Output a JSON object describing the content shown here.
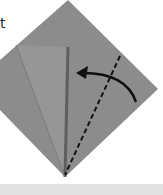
{
  "diagram": {
    "label_text": "t",
    "colors": {
      "paper": "#8c8c8c",
      "flap": "#969696",
      "crease_dark": "#5a5a5a",
      "fold_line": "#111111",
      "arrow": "#111111",
      "bottom_strip": "#e2e2e2"
    },
    "steps": [
      {
        "type": "valley-fold-line",
        "style": "dashed"
      },
      {
        "type": "fold-arrow",
        "direction": "left"
      }
    ]
  }
}
